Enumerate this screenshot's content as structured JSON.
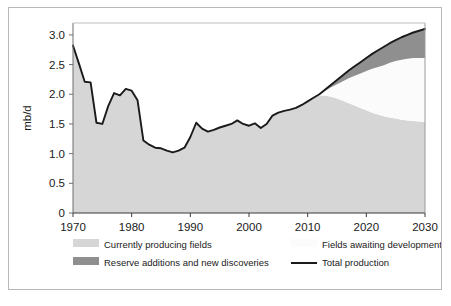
{
  "figure": {
    "background": "#ffffff",
    "frame_color": "#b9b9b9"
  },
  "axis": {
    "y_title": "mb/d",
    "y_ticks": [
      "0",
      "0.5",
      "1.0",
      "1.5",
      "2.0",
      "2.5",
      "3.0"
    ],
    "x_ticks": [
      "1970",
      "1980",
      "1990",
      "2000",
      "2010",
      "2020",
      "2030"
    ]
  },
  "legend": {
    "items": [
      {
        "label": "Currently producing fields",
        "swatch": "#d6d6d6",
        "type": "area"
      },
      {
        "label": "Fields awaiting development",
        "swatch": "#fbfbfb",
        "type": "area"
      },
      {
        "label": "Reserve additions and new discoveries",
        "swatch": "#8f8f8f",
        "type": "area"
      },
      {
        "label": "Total production",
        "swatch": "#1a1a1a",
        "type": "line"
      }
    ]
  },
  "chart_data": {
    "type": "area",
    "title": "",
    "subtitle": "",
    "xlabel": "",
    "ylabel": "mb/d",
    "xlim": [
      1970,
      2030
    ],
    "ylim": [
      0,
      3.2
    ],
    "grid": false,
    "legend_position": "bottom",
    "y_tick_values": [
      0,
      0.5,
      1.0,
      1.5,
      2.0,
      2.5,
      3.0
    ],
    "x_tick_values": [
      1970,
      1980,
      1990,
      2000,
      2010,
      2020,
      2030
    ],
    "colors": {
      "currently_producing_fields": "#d6d6d6",
      "fields_awaiting_development": "#fbfbfb",
      "reserve_additions_and_new_discoveries": "#8f8f8f",
      "total_production_line": "#1a1a1a"
    },
    "x": [
      1970,
      1971,
      1972,
      1973,
      1974,
      1975,
      1976,
      1977,
      1978,
      1979,
      1980,
      1981,
      1982,
      1983,
      1984,
      1985,
      1986,
      1987,
      1988,
      1989,
      1990,
      1991,
      1992,
      1993,
      1994,
      1995,
      1996,
      1997,
      1998,
      1999,
      2000,
      2001,
      2002,
      2003,
      2004,
      2005,
      2006,
      2007,
      2008,
      2009,
      2010,
      2011,
      2012,
      2013,
      2014,
      2015,
      2016,
      2017,
      2018,
      2019,
      2020,
      2021,
      2022,
      2023,
      2024,
      2025,
      2026,
      2027,
      2028,
      2029,
      2030
    ],
    "series": [
      {
        "name": "Total production",
        "type": "line",
        "values": [
          2.82,
          2.52,
          2.21,
          2.2,
          1.52,
          1.5,
          1.8,
          2.02,
          1.98,
          2.09,
          2.06,
          1.9,
          1.22,
          1.15,
          1.1,
          1.09,
          1.05,
          1.02,
          1.05,
          1.1,
          1.28,
          1.52,
          1.42,
          1.37,
          1.4,
          1.44,
          1.47,
          1.5,
          1.56,
          1.5,
          1.47,
          1.51,
          1.43,
          1.5,
          1.64,
          1.69,
          1.72,
          1.74,
          1.77,
          1.82,
          1.88,
          1.94,
          2.0,
          2.08,
          2.16,
          2.24,
          2.32,
          2.4,
          2.47,
          2.54,
          2.61,
          2.68,
          2.74,
          2.8,
          2.86,
          2.91,
          2.96,
          3.0,
          3.04,
          3.07,
          3.1
        ]
      },
      {
        "name": "Currently producing fields",
        "type": "area",
        "stack_order": 1,
        "values": [
          2.82,
          2.52,
          2.21,
          2.2,
          1.52,
          1.5,
          1.8,
          2.02,
          1.98,
          2.09,
          2.06,
          1.9,
          1.22,
          1.15,
          1.1,
          1.09,
          1.05,
          1.02,
          1.05,
          1.1,
          1.28,
          1.52,
          1.42,
          1.37,
          1.4,
          1.44,
          1.47,
          1.5,
          1.56,
          1.5,
          1.47,
          1.51,
          1.43,
          1.5,
          1.64,
          1.69,
          1.72,
          1.74,
          1.77,
          1.82,
          1.88,
          1.94,
          1.98,
          1.98,
          1.96,
          1.93,
          1.89,
          1.85,
          1.81,
          1.77,
          1.73,
          1.69,
          1.66,
          1.63,
          1.61,
          1.59,
          1.57,
          1.56,
          1.55,
          1.54,
          1.53
        ]
      },
      {
        "name": "Fields awaiting development",
        "type": "area",
        "stack_order": 2,
        "values": [
          0,
          0,
          0,
          0,
          0,
          0,
          0,
          0,
          0,
          0,
          0,
          0,
          0,
          0,
          0,
          0,
          0,
          0,
          0,
          0,
          0,
          0,
          0,
          0,
          0,
          0,
          0,
          0,
          0,
          0,
          0,
          0,
          0,
          0,
          0,
          0,
          0,
          0,
          0,
          0,
          0,
          0,
          0.02,
          0.08,
          0.16,
          0.24,
          0.33,
          0.42,
          0.5,
          0.58,
          0.66,
          0.74,
          0.8,
          0.86,
          0.92,
          0.97,
          1.01,
          1.04,
          1.06,
          1.07,
          1.08
        ]
      },
      {
        "name": "Reserve additions and new discoveries",
        "type": "area",
        "stack_order": 3,
        "values": [
          0,
          0,
          0,
          0,
          0,
          0,
          0,
          0,
          0,
          0,
          0,
          0,
          0,
          0,
          0,
          0,
          0,
          0,
          0,
          0,
          0,
          0,
          0,
          0,
          0,
          0,
          0,
          0,
          0,
          0,
          0,
          0,
          0,
          0,
          0,
          0,
          0,
          0,
          0,
          0,
          0,
          0,
          0,
          0.02,
          0.04,
          0.07,
          0.1,
          0.13,
          0.16,
          0.19,
          0.22,
          0.25,
          0.28,
          0.31,
          0.33,
          0.35,
          0.38,
          0.4,
          0.43,
          0.46,
          0.49
        ]
      }
    ]
  }
}
